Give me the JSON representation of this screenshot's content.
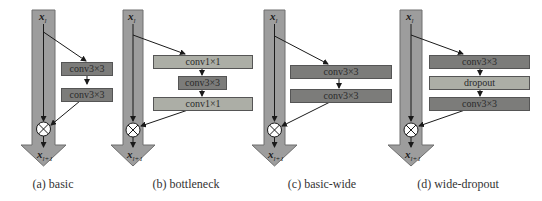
{
  "figure": {
    "panels": [
      {
        "id": "a",
        "caption": "(a) basic",
        "input_label": "x",
        "input_sub": "l",
        "output_label": "x",
        "output_sub": "l+1",
        "blocks": [
          {
            "label": "conv3×3",
            "style": "dark"
          },
          {
            "label": "conv3×3",
            "style": "dark"
          }
        ]
      },
      {
        "id": "b",
        "caption": "(b) bottleneck",
        "input_label": "x",
        "input_sub": "l",
        "output_label": "x",
        "output_sub": "l+1",
        "blocks": [
          {
            "label": "conv1×1",
            "style": "light"
          },
          {
            "label": "conv3×3",
            "style": "dark"
          },
          {
            "label": "conv1×1",
            "style": "light"
          }
        ]
      },
      {
        "id": "c",
        "caption": "(c) basic-wide",
        "input_label": "x",
        "input_sub": "l",
        "output_label": "x",
        "output_sub": "l+1",
        "blocks": [
          {
            "label": "conv3×3",
            "style": "dark"
          },
          {
            "label": "conv3×3",
            "style": "dark"
          }
        ]
      },
      {
        "id": "d",
        "caption": "(d) wide-dropout",
        "input_label": "x",
        "input_sub": "l",
        "output_label": "x",
        "output_sub": "l+1",
        "blocks": [
          {
            "label": "conv3×3",
            "style": "dark"
          },
          {
            "label": "dropout",
            "style": "light"
          },
          {
            "label": "conv3×3",
            "style": "dark"
          }
        ]
      }
    ],
    "operator_icon": "circled-times-icon",
    "colors": {
      "shaft": "#9d9d9d",
      "shaft_border": "#6e6e6e",
      "dark_block": "#7c7c7a",
      "light_block": "#acaea6",
      "line": "#1a1a1a"
    }
  }
}
